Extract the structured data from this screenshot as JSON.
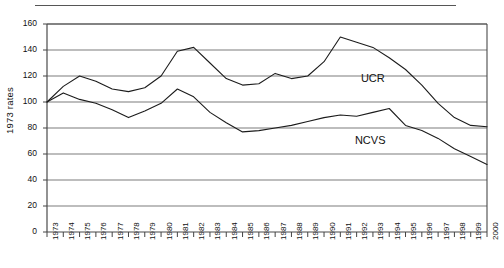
{
  "figure": {
    "ylabel": "1973 rates",
    "series_labels": {
      "ucr": "UCR",
      "ncvs": "NCVS"
    }
  },
  "chart_data": {
    "type": "line",
    "title": "",
    "subtitle": "",
    "xlabel": "",
    "ylabel": "1973 rates",
    "xlim": [
      1973,
      2000
    ],
    "ylim": [
      0,
      160
    ],
    "yticks": [
      0,
      20,
      40,
      60,
      80,
      100,
      120,
      140,
      160
    ],
    "ytick_labels": [
      "0",
      "20",
      "40",
      "60",
      "80",
      "100",
      "120",
      "140",
      "160"
    ],
    "grid": "horizontal",
    "legend": "inline-annotations",
    "x": [
      1973,
      1974,
      1975,
      1976,
      1977,
      1978,
      1979,
      1980,
      1981,
      1982,
      1983,
      1984,
      1985,
      1986,
      1987,
      1988,
      1989,
      1990,
      1991,
      1992,
      1993,
      1994,
      1995,
      1996,
      1997,
      1998,
      1999,
      2000
    ],
    "categories": [
      "1973",
      "1974",
      "1975",
      "1976",
      "1977",
      "1978",
      "1979",
      "1980",
      "1981",
      "1982",
      "1983",
      "1984",
      "1985",
      "1986",
      "1987",
      "1988",
      "1989",
      "1990",
      "1991",
      "1992",
      "1993",
      "1994",
      "1995",
      "1996",
      "1997",
      "1998",
      "1999",
      "2000"
    ],
    "series": [
      {
        "name": "UCR",
        "label_position": {
          "x": 1993,
          "y": 118
        },
        "values": [
          100,
          112,
          120,
          116,
          110,
          108,
          111,
          120,
          139,
          142,
          130,
          118,
          113,
          114,
          122,
          118,
          120,
          131,
          150,
          146,
          142,
          134,
          125,
          113,
          99,
          88,
          82,
          81
        ]
      },
      {
        "name": "NCVS",
        "label_position": {
          "x": 1993,
          "y": 70
        },
        "values": [
          100,
          107,
          102,
          99,
          94,
          88,
          93,
          99,
          110,
          104,
          92,
          84,
          77,
          78,
          80,
          82,
          85,
          88,
          90,
          89,
          92,
          95,
          82,
          78,
          72,
          64,
          58,
          52
        ]
      }
    ]
  }
}
